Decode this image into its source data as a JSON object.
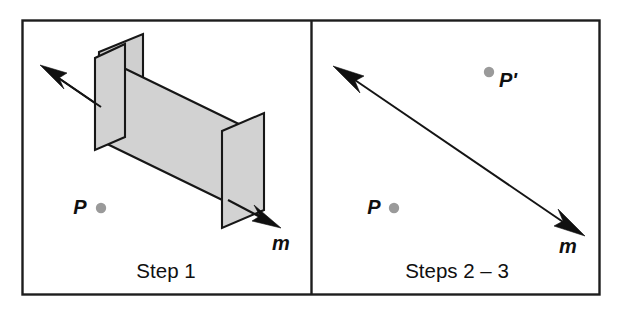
{
  "figure": {
    "background_color": "#ffffff",
    "frame_color": "#1d1d1d",
    "plane_fill_color": "#d2d2d2",
    "point_dot_color": "#9a9a9a",
    "line_color": "#101010"
  },
  "panels": [
    {
      "id": "panel-step-1",
      "caption": "Step 1",
      "labels": {
        "point_p": "P",
        "axis_m": "m"
      },
      "shapes": {
        "mirror_plane_near": "parallelogram",
        "mirror_plane_far": "parallelogram",
        "connecting_band": "parallelogram",
        "axis_arrow": "double-headed-arrow"
      }
    },
    {
      "id": "panel-steps-2-3",
      "caption": "Steps 2 – 3",
      "labels": {
        "point_p": "P",
        "point_p_prime": "P'",
        "axis_m": "m"
      },
      "shapes": {
        "axis_arrow": "double-headed-arrow"
      }
    }
  ]
}
